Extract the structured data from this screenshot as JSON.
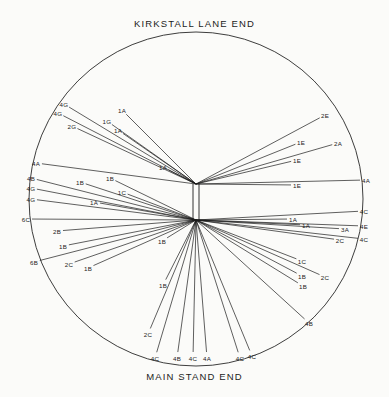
{
  "diagram": {
    "title_top": "KIRKSTALL LANE END",
    "title_bottom": "MAIN STAND END",
    "type": "shot-chart",
    "stroke_color": "#1b1b1b",
    "background_color": "#fbfbf9",
    "circle": {
      "cx": 196,
      "cy": 199,
      "r": 167
    },
    "hubs": [
      {
        "id": "north-goal",
        "x": 196,
        "y": 184
      },
      {
        "id": "south-goal",
        "x": 196,
        "y": 220
      }
    ],
    "shots": [
      {
        "id": 1,
        "label": "4G",
        "hub": "north-goal",
        "x": 64,
        "y": 104
      },
      {
        "id": 2,
        "label": "4G",
        "hub": "north-goal",
        "x": 58,
        "y": 113
      },
      {
        "id": 3,
        "label": "2G",
        "hub": "north-goal",
        "x": 72,
        "y": 126
      },
      {
        "id": 4,
        "label": "1A",
        "hub": "north-goal",
        "x": 122,
        "y": 110
      },
      {
        "id": 5,
        "label": "1G",
        "hub": "north-goal",
        "x": 107,
        "y": 121
      },
      {
        "id": 6,
        "label": "1A",
        "hub": "north-goal",
        "x": 118,
        "y": 130
      },
      {
        "id": 7,
        "label": "1A",
        "hub": "north-goal",
        "x": 163,
        "y": 167
      },
      {
        "id": 8,
        "label": "4A",
        "hub": "north-goal",
        "x": 36,
        "y": 163
      },
      {
        "id": 9,
        "label": "2E",
        "hub": "north-goal",
        "x": 325,
        "y": 115
      },
      {
        "id": 10,
        "label": "1E",
        "hub": "north-goal",
        "x": 301,
        "y": 142
      },
      {
        "id": 11,
        "label": "2A",
        "hub": "north-goal",
        "x": 338,
        "y": 143
      },
      {
        "id": 12,
        "label": "1E",
        "hub": "north-goal",
        "x": 297,
        "y": 160
      },
      {
        "id": 13,
        "label": "1E",
        "hub": "north-goal",
        "x": 297,
        "y": 185
      },
      {
        "id": 14,
        "label": "4A",
        "hub": "north-goal",
        "x": 366,
        "y": 180
      },
      {
        "id": 15,
        "label": "4B",
        "hub": "south-goal",
        "x": 31,
        "y": 178
      },
      {
        "id": 16,
        "label": "4G",
        "hub": "south-goal",
        "x": 31,
        "y": 188
      },
      {
        "id": 17,
        "label": "4G",
        "hub": "south-goal",
        "x": 31,
        "y": 199
      },
      {
        "id": 18,
        "label": "6C",
        "hub": "south-goal",
        "x": 26,
        "y": 219
      },
      {
        "id": 19,
        "label": "1B",
        "hub": "south-goal",
        "x": 80,
        "y": 182
      },
      {
        "id": 20,
        "label": "1B",
        "hub": "south-goal",
        "x": 110,
        "y": 178
      },
      {
        "id": 21,
        "label": "1C",
        "hub": "south-goal",
        "x": 122,
        "y": 192
      },
      {
        "id": 22,
        "label": "1A",
        "hub": "south-goal",
        "x": 94,
        "y": 202
      },
      {
        "id": 23,
        "label": "2B",
        "hub": "south-goal",
        "x": 57,
        "y": 231
      },
      {
        "id": 24,
        "label": "1B",
        "hub": "south-goal",
        "x": 63,
        "y": 246
      },
      {
        "id": 25,
        "label": "6B",
        "hub": "south-goal",
        "x": 34,
        "y": 262
      },
      {
        "id": 26,
        "label": "2C",
        "hub": "south-goal",
        "x": 69,
        "y": 264
      },
      {
        "id": 27,
        "label": "1B",
        "hub": "south-goal",
        "x": 88,
        "y": 268
      },
      {
        "id": 28,
        "label": "1B",
        "hub": "south-goal",
        "x": 162,
        "y": 241
      },
      {
        "id": 29,
        "label": "1B",
        "hub": "south-goal",
        "x": 163,
        "y": 285
      },
      {
        "id": 30,
        "label": "1A",
        "hub": "south-goal",
        "x": 293,
        "y": 219
      },
      {
        "id": 31,
        "label": "1A",
        "hub": "south-goal",
        "x": 306,
        "y": 225
      },
      {
        "id": 32,
        "label": "3A",
        "hub": "south-goal",
        "x": 345,
        "y": 229
      },
      {
        "id": 33,
        "label": "4C",
        "hub": "south-goal",
        "x": 364,
        "y": 211
      },
      {
        "id": 34,
        "label": "4E",
        "hub": "south-goal",
        "x": 364,
        "y": 226
      },
      {
        "id": 35,
        "label": "2C",
        "hub": "south-goal",
        "x": 340,
        "y": 240
      },
      {
        "id": 36,
        "label": "4C",
        "hub": "south-goal",
        "x": 364,
        "y": 239
      },
      {
        "id": 37,
        "label": "1C",
        "hub": "south-goal",
        "x": 302,
        "y": 261
      },
      {
        "id": 38,
        "label": "1B",
        "hub": "south-goal",
        "x": 302,
        "y": 276
      },
      {
        "id": 39,
        "label": "2C",
        "hub": "south-goal",
        "x": 325,
        "y": 277
      },
      {
        "id": 40,
        "label": "1B",
        "hub": "south-goal",
        "x": 303,
        "y": 286
      },
      {
        "id": 41,
        "label": "4B",
        "hub": "south-goal",
        "x": 309,
        "y": 323
      },
      {
        "id": 42,
        "label": "2C",
        "hub": "south-goal",
        "x": 148,
        "y": 334
      },
      {
        "id": 43,
        "label": "4C",
        "hub": "south-goal",
        "x": 155,
        "y": 358
      },
      {
        "id": 44,
        "label": "4B",
        "hub": "south-goal",
        "x": 177,
        "y": 358
      },
      {
        "id": 45,
        "label": "4C",
        "hub": "south-goal",
        "x": 193,
        "y": 358
      },
      {
        "id": 46,
        "label": "4A",
        "hub": "south-goal",
        "x": 207,
        "y": 358
      },
      {
        "id": 47,
        "label": "4C",
        "hub": "south-goal",
        "x": 240,
        "y": 358
      },
      {
        "id": 48,
        "label": "4C",
        "hub": "south-goal",
        "x": 252,
        "y": 356
      }
    ]
  }
}
